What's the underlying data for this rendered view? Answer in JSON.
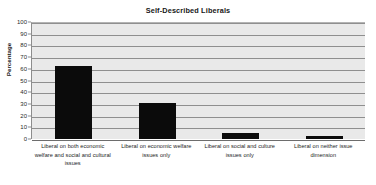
{
  "chart_data": {
    "type": "bar",
    "title": "Self-Described Liberals",
    "xlabel": "",
    "ylabel": "Percentage",
    "ylim": [
      0,
      100
    ],
    "yticks": [
      0,
      10,
      20,
      30,
      40,
      50,
      60,
      70,
      80,
      90,
      100
    ],
    "grid": true,
    "legend": false,
    "bar_color": "#0b0b0b",
    "plot_background": "#e9e9e9",
    "gridline_color": "#8f8f8f",
    "categories": [
      "Liberal on both economic welfare and social and cultural issues",
      "Liberal on economic welfare issues only",
      "Liberal on social and culture issues only",
      "Liberal on neither issue dimension"
    ],
    "values": [
      62,
      31,
      5,
      3
    ]
  },
  "axis": {
    "y_tick_labels": [
      "100",
      "90",
      "80",
      "70",
      "60",
      "50",
      "40",
      "30",
      "20",
      "10",
      "0"
    ]
  }
}
